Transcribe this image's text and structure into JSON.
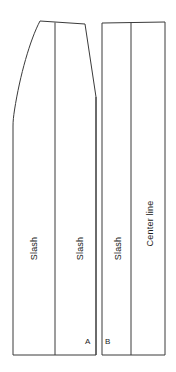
{
  "figure": {
    "type": "technical-pattern-diagram",
    "background_color": "#ffffff",
    "line_color": "#3a3a3a",
    "text_color": "#1c1c1c",
    "width": 176,
    "height": 372
  },
  "labels": {
    "slash_1": "Slash",
    "slash_2": "Slash",
    "slash_3": "Slash",
    "center_line": "Center line",
    "point_a": "A",
    "point_b": "B"
  },
  "geometry": {
    "bottom_y": 355,
    "left_edge_x": 13,
    "right_edge_x": 165,
    "top_left_peak": [
      40,
      21
    ],
    "notch_left_top": [
      85,
      24
    ],
    "notch_vertex": [
      96,
      97
    ],
    "notch_right_top": [
      103,
      23
    ],
    "top_right": [
      165,
      22
    ],
    "vertical_lines_x": [
      55,
      96,
      102,
      131
    ],
    "notch_gap_width": 6
  }
}
